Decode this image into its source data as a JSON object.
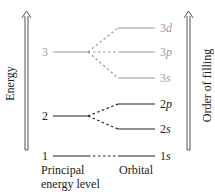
{
  "diagram": {
    "axes": {
      "left_label": "Energy",
      "right_label": "Order of filling"
    },
    "levels": [
      {
        "principal": "3",
        "orbitals": [
          "3s",
          "3p",
          "3d"
        ]
      },
      {
        "principal": "2",
        "orbitals": [
          "2s",
          "2p"
        ]
      },
      {
        "principal": "1",
        "orbitals": [
          "1s"
        ]
      }
    ],
    "labels": {
      "n3": "3",
      "n2": "2",
      "n1": "1",
      "o3d_num": "3",
      "o3d_let": "d",
      "o3p_num": "3",
      "o3p_let": "p",
      "o3s_num": "3",
      "o3s_let": "s",
      "o2p_num": "2",
      "o2p_let": "p",
      "o2s_num": "2",
      "o2s_let": "s",
      "o1s_num": "1",
      "o1s_let": "s",
      "principal_caption_line1": "Principal",
      "principal_caption_line2": "energy level",
      "orbital_caption": "Orbital"
    },
    "colors": {
      "level3": "#9a9a9a",
      "level_other": "#222222"
    }
  }
}
